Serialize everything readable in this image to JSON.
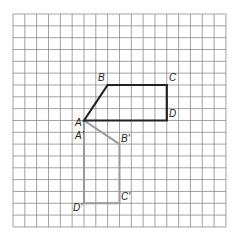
{
  "grid": {
    "columns": 18,
    "rows": 18,
    "origin_px": [
      13,
      14
    ],
    "cell_px": 11.83,
    "line_color": "#8a8a8a"
  },
  "shapes": [
    {
      "name": "original-quadrilateral",
      "color": "#222222",
      "stroke_width": 2.2,
      "vertices": [
        {
          "label": "A",
          "grid": [
            6,
            9
          ]
        },
        {
          "label": "B",
          "grid": [
            8,
            6
          ]
        },
        {
          "label": "C",
          "grid": [
            13,
            6
          ]
        },
        {
          "label": "D",
          "grid": [
            13,
            9
          ]
        }
      ]
    },
    {
      "name": "image-quadrilateral",
      "color": "#9a9a9a",
      "stroke_width": 2,
      "vertices": [
        {
          "label": "A'",
          "grid": [
            6,
            9
          ]
        },
        {
          "label": "B'",
          "grid": [
            9,
            11
          ]
        },
        {
          "label": "C'",
          "grid": [
            9,
            16
          ]
        },
        {
          "label": "D'",
          "grid": [
            6,
            16
          ]
        }
      ]
    }
  ],
  "labels": {
    "A": "A",
    "B": "B",
    "C": "C",
    "D": "D",
    "A_prime": "A'",
    "B_prime": "B'",
    "C_prime": "C'",
    "D_prime": "D'"
  }
}
